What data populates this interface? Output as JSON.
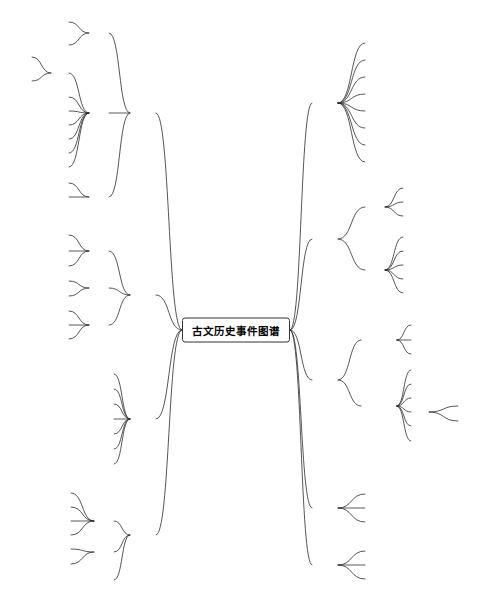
{
  "diagram": {
    "type": "mind-map",
    "root": {
      "label": "古文历史事件图谱",
      "x": 236,
      "y": 330
    },
    "watermark": "",
    "branches": [
      {
        "label": "军事",
        "side": "left",
        "x": 143,
        "y": 113,
        "children": [
          {
            "label": "备战",
            "x": 99,
            "y": 33,
            "children": [
              {
                "label": "出兵",
                "x": 60,
                "y": 22
              },
              {
                "label": "屯扎",
                "x": 60,
                "y": 45
              }
            ]
          },
          {
            "label": "作战",
            "x": 99,
            "y": 113,
            "children": [
              {
                "label": "攻击",
                "x": 60,
                "y": 73,
                "children": [
                  {
                    "label": "征伐",
                    "x": 23,
                    "y": 57
                  },
                  {
                    "label": "侵袭",
                    "x": 23,
                    "y": 81
                  }
                ]
              },
              {
                "label": "防守",
                "x": 60,
                "y": 97
              },
              {
                "label": "谋反",
                "x": 60,
                "y": 111
              },
              {
                "label": "杀害",
                "x": 60,
                "y": 125
              },
              {
                "label": "救援",
                "x": 60,
                "y": 139
              },
              {
                "label": "撤退",
                "x": 60,
                "y": 153
              },
              {
                "label": "俘虏",
                "x": 60,
                "y": 167
              }
            ]
          },
          {
            "label": "停战",
            "x": 99,
            "y": 197,
            "children": [
              {
                "label": "战败",
                "x": 60,
                "y": 183
              },
              {
                "label": "战胜",
                "x": 60,
                "y": 197
              }
            ]
          }
        ]
      },
      {
        "label": "经济",
        "side": "left",
        "x": 143,
        "y": 295,
        "children": [
          {
            "label": "赋税",
            "x": 99,
            "y": 251,
            "children": [
              {
                "label": "征税",
                "x": 60,
                "y": 235
              },
              {
                "label": "减税",
                "x": 60,
                "y": 251
              },
              {
                "label": "免税",
                "x": 60,
                "y": 266
              }
            ]
          },
          {
            "label": "买卖",
            "x": 99,
            "y": 288,
            "children": [
              {
                "label": "买入",
                "x": 60,
                "y": 281
              },
              {
                "label": "卖出",
                "x": 60,
                "y": 296
              }
            ]
          },
          {
            "label": "生产",
            "x": 99,
            "y": 325,
            "children": [
              {
                "label": "耕种",
                "x": 60,
                "y": 311
              },
              {
                "label": "打猎",
                "x": 60,
                "y": 325
              },
              {
                "label": "建造",
                "x": 60,
                "y": 339
              }
            ]
          }
        ]
      },
      {
        "label": "法律",
        "side": "left",
        "x": 143,
        "y": 419,
        "children": [
          {
            "label": "立法",
            "x": 104,
            "y": 374
          },
          {
            "label": "废法",
            "x": 104,
            "y": 389
          },
          {
            "label": "犯罪",
            "x": 104,
            "y": 404
          },
          {
            "label": "逮捕",
            "x": 104,
            "y": 419
          },
          {
            "label": "赦免",
            "x": 104,
            "y": 434
          },
          {
            "label": "处死",
            "x": 104,
            "y": 449
          },
          {
            "label": "流放",
            "x": 104,
            "y": 464
          }
        ]
      },
      {
        "label": "自然",
        "side": "left",
        "x": 143,
        "y": 535,
        "children": [
          {
            "label": "灾害",
            "x": 104,
            "y": 521,
            "children": [
              {
                "label": "饥荒",
                "x": 62,
                "y": 493
              },
              {
                "label": "地震",
                "x": 62,
                "y": 507
              },
              {
                "label": "蝗灾",
                "x": 62,
                "y": 521
              },
              {
                "label": "水灾",
                "x": 62,
                "y": 535
              }
            ]
          },
          {
            "label": "天象",
            "x": 104,
            "y": 552,
            "children": [
              {
                "label": "日食",
                "x": 62,
                "y": 549
              },
              {
                "label": "流星",
                "x": 62,
                "y": 564
              }
            ]
          },
          {
            "label": "天气",
            "x": 104,
            "y": 580
          }
        ]
      },
      {
        "label": "人生",
        "side": "right",
        "x": 325,
        "y": 103,
        "children": [
          {
            "label": "出生",
            "x": 375,
            "y": 43
          },
          {
            "label": "结婚",
            "x": 375,
            "y": 60
          },
          {
            "label": "生病",
            "x": 375,
            "y": 77
          },
          {
            "label": "受伤",
            "x": 375,
            "y": 94
          },
          {
            "label": "死亡",
            "x": 375,
            "y": 111
          },
          {
            "label": "安葬",
            "x": 375,
            "y": 128
          },
          {
            "label": "分封",
            "x": 375,
            "y": 145
          },
          {
            "label": "立储",
            "x": 375,
            "y": 162
          }
        ]
      },
      {
        "label": "职位",
        "side": "right",
        "x": 325,
        "y": 239,
        "children": [
          {
            "label": "帝位",
            "x": 375,
            "y": 207,
            "children": [
              {
                "label": "确立",
                "x": 412,
                "y": 188
              },
              {
                "label": "继位",
                "x": 412,
                "y": 202
              },
              {
                "label": "即位",
                "x": 412,
                "y": 216
              }
            ]
          },
          {
            "label": "官位",
            "x": 375,
            "y": 270,
            "children": [
              {
                "label": "任职",
                "x": 412,
                "y": 237
              },
              {
                "label": "免职",
                "x": 412,
                "y": 251
              },
              {
                "label": "升职",
                "x": 412,
                "y": 265
              },
              {
                "label": "降职",
                "x": 412,
                "y": 279
              },
              {
                "label": "兼职",
                "x": 412,
                "y": 293
              }
            ]
          }
        ]
      },
      {
        "label": "交流",
        "side": "right",
        "x": 325,
        "y": 380,
        "children": [
          {
            "label": "国家交流",
            "x": 379,
            "y": 340,
            "children": [
              {
                "label": "出使",
                "x": 420,
                "y": 325
              },
              {
                "label": "盟约",
                "x": 420,
                "y": 340
              },
              {
                "label": "朝贺",
                "x": 420,
                "y": 354
              }
            ]
          },
          {
            "label": "个人交流",
            "x": 379,
            "y": 406,
            "children": [
              {
                "label": "见面",
                "x": 420,
                "y": 370
              },
              {
                "label": "商议",
                "x": 420,
                "y": 384
              },
              {
                "label": "询问",
                "x": 420,
                "y": 398
              },
              {
                "label": "诏令",
                "x": 420,
                "y": 412,
                "children": [
                  {
                    "label": "下诏",
                    "x": 467,
                    "y": 406
                  },
                  {
                    "label": "命令",
                    "x": 467,
                    "y": 421
                  }
                ]
              },
              {
                "label": "谏言",
                "x": 420,
                "y": 426
              },
              {
                "label": "推荐",
                "x": 420,
                "y": 441
              }
            ]
          }
        ]
      },
      {
        "label": "移动",
        "side": "right",
        "x": 325,
        "y": 508,
        "children": [
          {
            "label": "到达",
            "x": 375,
            "y": 494
          },
          {
            "label": "停留",
            "x": 375,
            "y": 508
          },
          {
            "label": "离开",
            "x": 375,
            "y": 522
          }
        ]
      },
      {
        "label": "祭祀",
        "side": "right",
        "x": 325,
        "y": 565,
        "children": [
          {
            "label": "祭地祇",
            "x": 379,
            "y": 551
          },
          {
            "label": "祭人鬼",
            "x": 379,
            "y": 565
          },
          {
            "label": "祭天神",
            "x": 379,
            "y": 579
          }
        ]
      }
    ]
  }
}
